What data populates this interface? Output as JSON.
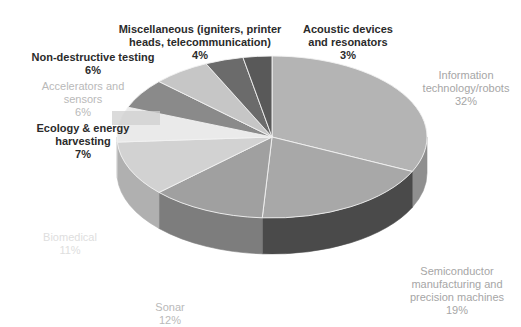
{
  "chart_data": {
    "type": "pie",
    "title": "",
    "subtitle": "",
    "xlabel": "",
    "ylabel": "",
    "legend_position": "none",
    "grid": false,
    "style": "3d-exploded-none",
    "units": "percent",
    "total": 100,
    "categories": [
      "Information technology/robots",
      "Semiconductor manufacturing and precision machines",
      "Sonar",
      "Biomedical",
      "Ecology & energy harvesting",
      "Accelerators and sensors",
      "Non-destructive testing",
      "Miscellaneous (igniters, printer heads, telecommunication)",
      "Acoustic devices and resonators"
    ],
    "values": [
      32,
      19,
      12,
      11,
      7,
      6,
      6,
      4,
      3
    ],
    "slices": [
      {
        "label": "Information technology/robots",
        "value": 32,
        "pct_text": "32%",
        "color": "#b4b4b4",
        "side_color": "#8f8f8f"
      },
      {
        "label": "Semiconductor manufacturing and precision machines",
        "value": 19,
        "pct_text": "19%",
        "color": "#a8a8a8",
        "side_color": "#4a4a4a"
      },
      {
        "label": "Sonar",
        "value": 12,
        "pct_text": "12%",
        "color": "#a0a0a0",
        "side_color": "#7d7d7d"
      },
      {
        "label": "Biomedical",
        "value": 11,
        "pct_text": "11%",
        "color": "#d2d2d2",
        "side_color": "#b0b0b0"
      },
      {
        "label": "Ecology & energy harvesting",
        "value": 7,
        "pct_text": "7%",
        "color": "#eaeaea",
        "side_color": "#c6c6c6"
      },
      {
        "label": "Accelerators and sensors",
        "value": 6,
        "pct_text": "6%",
        "color": "#8a8a8a",
        "side_color": "#6f6f6f"
      },
      {
        "label": "Non-destructive testing",
        "value": 6,
        "pct_text": "6%",
        "color": "#c6c6c6",
        "side_color": "#a2a2a2"
      },
      {
        "label": "Miscellaneous (igniters, printer heads, telecommunication)",
        "value": 4,
        "pct_text": "4%",
        "color": "#6b6b6b",
        "side_color": "#565656"
      },
      {
        "label": "Acoustic devices and resonators",
        "value": 3,
        "pct_text": "3%",
        "color": "#595959",
        "side_color": "#474747"
      }
    ]
  },
  "labels": {
    "info_tech": {
      "name": "Information\ntechnology/robots",
      "pct": "32%"
    },
    "semiconductor": {
      "name": "Semiconductor\nmanufacturing and\nprecision machines",
      "pct": "19%"
    },
    "sonar": {
      "name": "Sonar",
      "pct": "12%"
    },
    "biomedical": {
      "name": "Biomedical",
      "pct": "11%"
    },
    "ecology": {
      "name": "Ecology & energy\nharvesting",
      "pct": "7%"
    },
    "accelerators": {
      "name": "Accelerators and\nsensors",
      "pct": "6%"
    },
    "nondestructive": {
      "name": "Non-destructive testing",
      "pct": "6%"
    },
    "miscellaneous": {
      "name": "Miscellaneous (igniters, printer\nheads, telecommunication)",
      "pct": "4%"
    },
    "acoustic": {
      "name": "Acoustic devices\nand resonators",
      "pct": "3%"
    }
  }
}
